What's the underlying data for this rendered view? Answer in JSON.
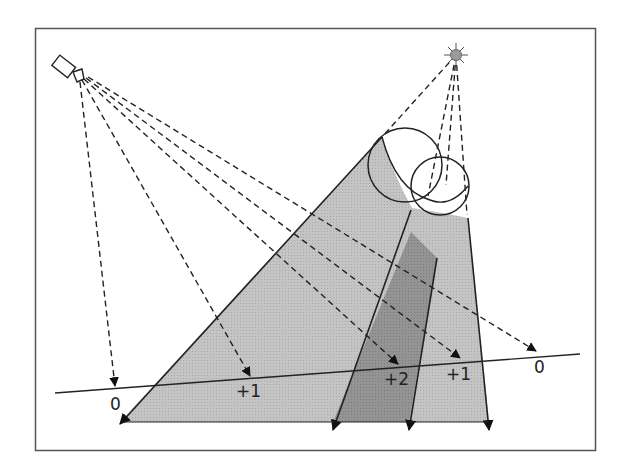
{
  "diagram": {
    "type": "optical-geometry",
    "frame": {
      "x": 35,
      "y": 28,
      "width": 560,
      "height": 422
    },
    "camera": {
      "label": "camera-icon",
      "lens": [
        78,
        78
      ]
    },
    "light_source": {
      "label": "light-source-icon",
      "center": [
        456,
        55
      ]
    },
    "colors": {
      "beam_light": "#bdbdbd",
      "beam_dark": "#8f8f8f",
      "stroke": "#222222",
      "frame": "#555555",
      "sun": "#9a9a9a"
    },
    "ground_line": {
      "from": [
        55,
        393
      ],
      "to": [
        580,
        354
      ]
    },
    "labels": [
      {
        "id": "label-0-left",
        "text": "0",
        "x": 110,
        "y": 396
      },
      {
        "id": "label-plus1-left",
        "text": "+1",
        "x": 236,
        "y": 384
      },
      {
        "id": "label-plus2",
        "text": "+2",
        "x": 384,
        "y": 372
      },
      {
        "id": "label-plus1-right",
        "text": "+1",
        "x": 446,
        "y": 367
      },
      {
        "id": "label-0-right",
        "text": "0",
        "x": 534,
        "y": 360
      }
    ],
    "camera_rays": [
      {
        "to": [
          115,
          388
        ],
        "value": "0"
      },
      {
        "to": [
          250,
          378
        ],
        "value": "+1"
      },
      {
        "to": [
          398,
          366
        ],
        "value": "+2"
      },
      {
        "to": [
          460,
          360
        ],
        "value": "+1"
      },
      {
        "to": [
          536,
          352
        ],
        "value": "0"
      }
    ]
  }
}
